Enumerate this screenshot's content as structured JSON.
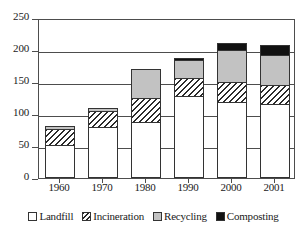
{
  "chart_data": {
    "type": "bar",
    "stacked": true,
    "title": "",
    "subtitle": "",
    "xlabel": "",
    "ylabel": "",
    "categories": [
      "1960",
      "1970",
      "1980",
      "1990",
      "2000",
      "2001"
    ],
    "series": [
      {
        "name": "Landfill",
        "color": "#ffffff",
        "pattern": "solid-white",
        "values": [
          52,
          80,
          88,
          128,
          118,
          115
        ]
      },
      {
        "name": "Incineration",
        "color": "#2b2b2b",
        "pattern": "diagonal-hatch",
        "values": [
          24,
          24,
          37,
          28,
          32,
          30
        ]
      },
      {
        "name": "Recycling",
        "color": "#c2c2c2",
        "pattern": "solid-gray",
        "values": [
          5,
          6,
          45,
          29,
          50,
          48
        ]
      },
      {
        "name": "Composting",
        "color": "#111111",
        "pattern": "solid-black",
        "values": [
          0,
          0,
          0,
          3,
          11,
          15
        ]
      }
    ],
    "totals": [
      81,
      110,
      170,
      188,
      211,
      208
    ],
    "ylim": [
      0,
      250
    ],
    "yticks": [
      0,
      50,
      100,
      150,
      200,
      250
    ],
    "ytick_labels": [
      "0",
      "50",
      "100",
      "150",
      "200",
      "250"
    ],
    "gridlines": [
      50,
      100,
      150,
      200
    ],
    "grid": true,
    "legend_position": "bottom",
    "legend": [
      "Landfill",
      "Incineration",
      "Recycling",
      "Composting"
    ]
  }
}
